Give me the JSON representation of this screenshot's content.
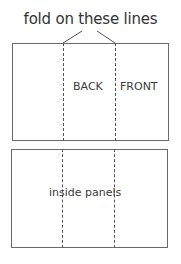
{
  "diagram": {
    "title": "fold on these lines",
    "top_sheet": {
      "panels": [
        "",
        "BACK",
        "FRONT"
      ]
    },
    "bottom_sheet": {
      "label": "inside panels"
    },
    "colors": {
      "line": "#6a6a6a",
      "text": "#3a3a3a"
    }
  }
}
